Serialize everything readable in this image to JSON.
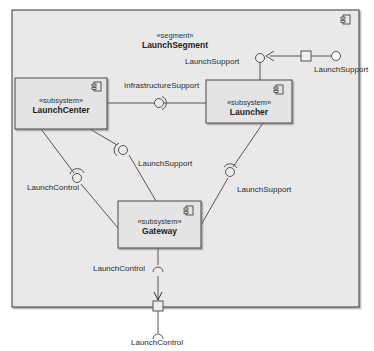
{
  "segment": {
    "stereotype": "«segment»",
    "name": "LaunchSegment"
  },
  "components": [
    {
      "id": "launch-center",
      "stereotype": "«subsystem»",
      "name": "LaunchCenter"
    },
    {
      "id": "launcher",
      "stereotype": "«subsystem»",
      "name": "Launcher"
    },
    {
      "id": "gateway",
      "stereotype": "«subsystem»",
      "name": "Gateway"
    }
  ],
  "interfaces": {
    "infrastructure_support": "InfrastructureSupport",
    "launch_support_port_inner": "LaunchSupport",
    "launch_support_port_outer": "LaunchSupport",
    "launch_support_center_gateway": "LaunchSupport",
    "launch_support_launcher_gateway": "LaunchSupport",
    "launch_control_center_gateway": "LaunchControl",
    "launch_control_gateway_port_inner": "LaunchControl",
    "launch_control_gateway_port_outer": "LaunchControl"
  },
  "colors": {
    "frame_fill": "#e9e9e9",
    "box_fill": "#e4e4e4",
    "stroke": "#555555"
  }
}
